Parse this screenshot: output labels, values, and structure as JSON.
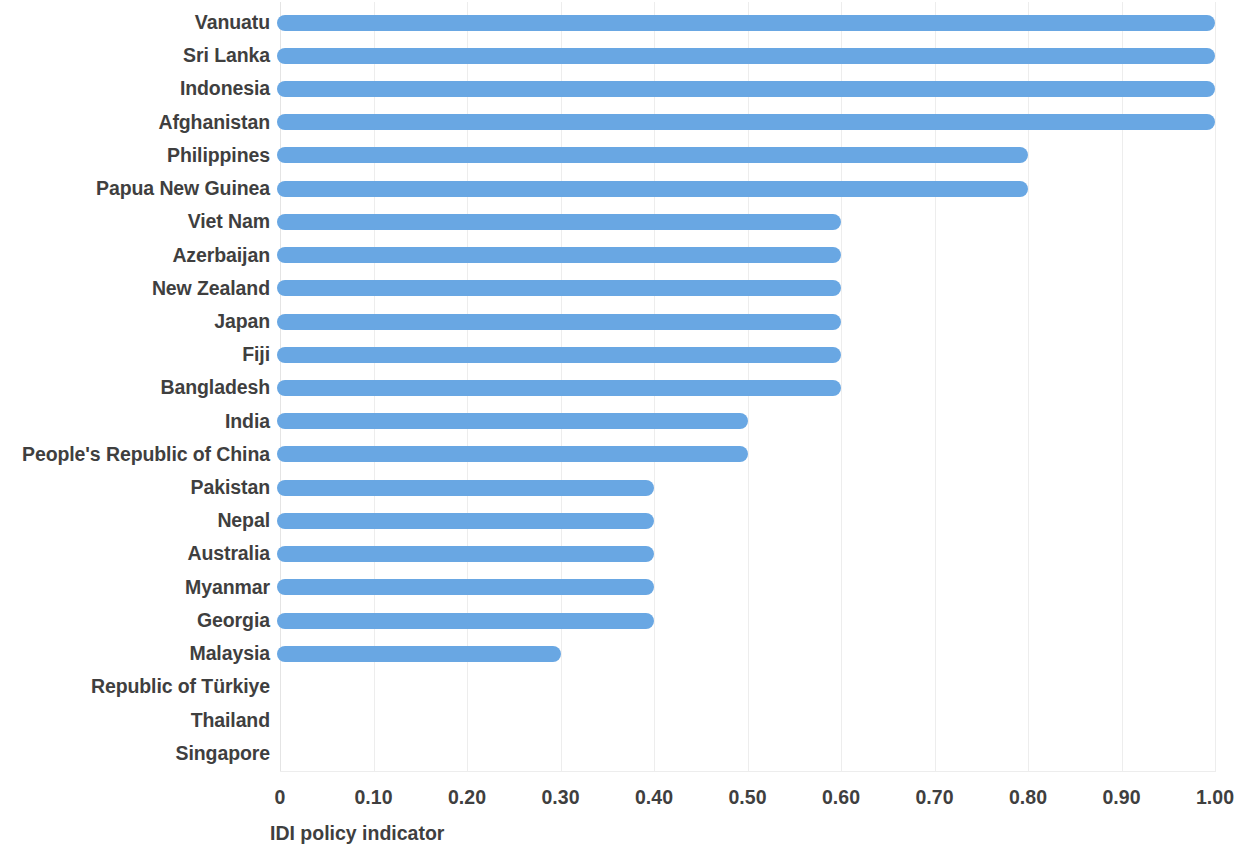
{
  "chart_data": {
    "type": "bar",
    "orientation": "horizontal",
    "title": "",
    "subtitle": "",
    "xlabel": "IDI policy indicator",
    "ylabel": "",
    "xlim": [
      0,
      1.0
    ],
    "xticks": [
      0,
      0.1,
      0.2,
      0.3,
      0.4,
      0.5,
      0.6,
      0.7,
      0.8,
      0.9,
      1.0
    ],
    "xtick_labels": [
      "0",
      "0.10",
      "0.20",
      "0.30",
      "0.40",
      "0.50",
      "0.60",
      "0.70",
      "0.80",
      "0.90",
      "1.00"
    ],
    "grid": "vertical",
    "legend": "none",
    "bar_color": "#69a7e3",
    "label_color": "#3f3f3f",
    "gridline_color": "#ededed",
    "background": "#ffffff",
    "categories": [
      "Vanuatu",
      "Sri Lanka",
      "Indonesia",
      "Afghanistan",
      "Philippines",
      "Papua New Guinea",
      "Viet Nam",
      "Azerbaijan",
      "New Zealand",
      "Japan",
      "Fiji",
      "Bangladesh",
      "India",
      "People's Republic of China",
      "Pakistan",
      "Nepal",
      "Australia",
      "Myanmar",
      "Georgia",
      "Malaysia",
      "Republic of Türkiye",
      "Thailand",
      "Singapore"
    ],
    "values": [
      1.0,
      1.0,
      1.0,
      1.0,
      0.8,
      0.8,
      0.6,
      0.6,
      0.6,
      0.6,
      0.6,
      0.6,
      0.5,
      0.5,
      0.4,
      0.4,
      0.4,
      0.4,
      0.4,
      0.3,
      0.0,
      0.0,
      0.0
    ]
  }
}
